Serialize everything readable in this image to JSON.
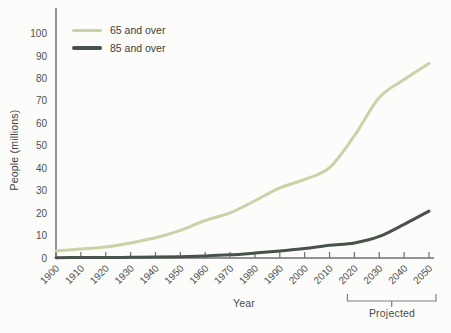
{
  "colors": {
    "background": "#fcfcfa",
    "axis": "#6f6f6f",
    "tick_label": "#4f4f4f",
    "bracket": "#7d7d7d",
    "series_65": "#c8d3a7",
    "series_85": "#49524a"
  },
  "chart_data": {
    "type": "line",
    "title": "",
    "xlabel": "Year",
    "ylabel": "People (millions)",
    "x": [
      1900,
      1910,
      1920,
      1930,
      1940,
      1950,
      1960,
      1970,
      1980,
      1990,
      2000,
      2010,
      2020,
      2030,
      2040,
      2050
    ],
    "yticks": [
      0,
      10,
      20,
      30,
      40,
      50,
      60,
      70,
      80,
      90,
      100
    ],
    "xlim": [
      1900,
      2050
    ],
    "ylim": [
      0,
      105
    ],
    "grid": false,
    "legend_position": "top-left",
    "series": [
      {
        "name": "65 and over",
        "color": "#c8d3a7",
        "values": [
          3.1,
          4.0,
          4.9,
          6.7,
          9.0,
          12.3,
          16.7,
          20.1,
          25.5,
          31.2,
          35.0,
          40.3,
          54.5,
          71.5,
          79.5,
          86.7
        ]
      },
      {
        "name": "85 and over",
        "color": "#49524a",
        "values": [
          0.1,
          0.2,
          0.2,
          0.3,
          0.4,
          0.6,
          0.9,
          1.4,
          2.2,
          3.1,
          4.2,
          5.7,
          6.7,
          9.6,
          15.0,
          20.9
        ]
      }
    ],
    "annotation": {
      "label": "Projected",
      "x_from": 2020,
      "x_to": 2050
    }
  }
}
